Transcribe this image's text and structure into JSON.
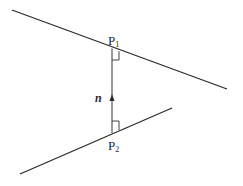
{
  "diagram": {
    "type": "skew-lines-common-perpendicular",
    "labels": {
      "p1_main": "P",
      "p1_sub": "1",
      "p2_main": "P",
      "p2_sub": "2",
      "normal": "n"
    },
    "colors": {
      "line": "#2a2a2a",
      "segment": "#555555",
      "background": "#ffffff"
    }
  }
}
